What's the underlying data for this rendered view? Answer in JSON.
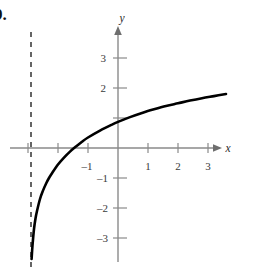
{
  "figure": {
    "problem_number": "9.",
    "background_color": "#ffffff",
    "axis_color": "#8a8a8a",
    "curve_color": "#000000",
    "asymptote_color": "#4a4a4a",
    "label_color": "#3a3a3a"
  },
  "axes": {
    "x_axis_label": "x",
    "y_axis_label": "y",
    "x_ticks": [
      {
        "value": -1,
        "label": "–1"
      },
      {
        "value": 1,
        "label": "1"
      },
      {
        "value": 2,
        "label": "2"
      },
      {
        "value": 3,
        "label": "3"
      }
    ],
    "y_ticks": [
      {
        "value": 3,
        "label": "3"
      },
      {
        "value": 2,
        "label": "2"
      },
      {
        "value": 1,
        "label": ""
      },
      {
        "value": -1,
        "label": "–1"
      },
      {
        "value": -2,
        "label": "–2"
      },
      {
        "value": -3,
        "label": "–3"
      }
    ]
  },
  "chart_data": {
    "type": "line",
    "title": "",
    "xlabel": "x",
    "ylabel": "y",
    "xlim": [
      -3.9,
      3.9
    ],
    "ylim": [
      -3.9,
      3.6
    ],
    "grid": false,
    "legend": false,
    "annotations": [
      {
        "kind": "vertical-asymptote",
        "x": -2.9,
        "style": "dashed"
      }
    ],
    "series": [
      {
        "name": "logarithmic-curve",
        "style": "solid",
        "color": "#000000",
        "x": [
          -2.88,
          -2.85,
          -2.8,
          -2.75,
          -2.7,
          -2.6,
          -2.5,
          -2.4,
          -2.3,
          -2.2,
          -2.0,
          -1.8,
          -1.6,
          -1.4,
          -1.2,
          -1.0,
          -0.6,
          -0.2,
          0.0,
          0.4,
          0.8,
          1.2,
          1.6,
          2.0,
          2.4,
          2.8,
          3.2,
          3.6
        ],
        "y": [
          -3.7,
          -3.25,
          -2.7,
          -2.35,
          -2.1,
          -1.7,
          -1.42,
          -1.19,
          -1.0,
          -0.84,
          -0.55,
          -0.32,
          -0.12,
          0.05,
          0.21,
          0.35,
          0.58,
          0.78,
          0.87,
          1.03,
          1.17,
          1.29,
          1.4,
          1.49,
          1.58,
          1.66,
          1.73,
          1.8
        ]
      }
    ]
  }
}
